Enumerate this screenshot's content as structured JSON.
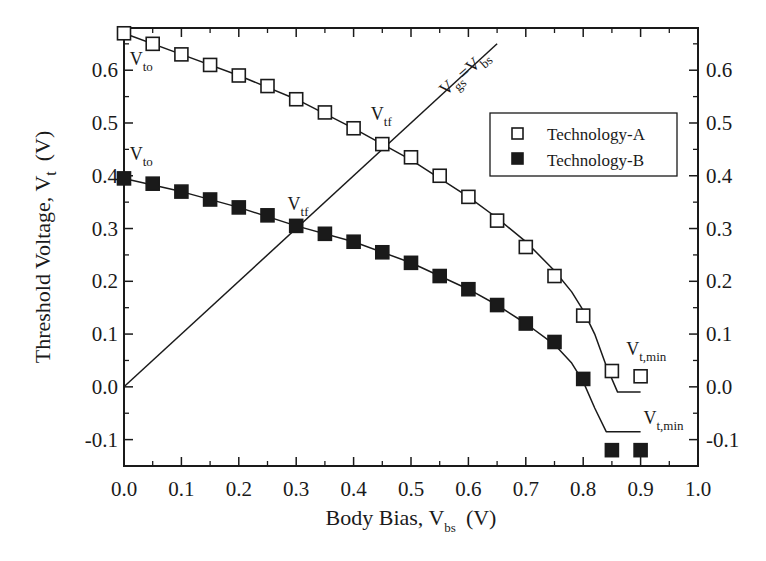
{
  "chart_data": {
    "type": "scatter",
    "title": "",
    "xlabel": "Body Bias, V",
    "xlabel_sub": "bs",
    "xlabel_unit": "(V)",
    "ylabel": "Threshold Voltage, V",
    "ylabel_sub": "t",
    "ylabel_unit": "(V)",
    "xlim": [
      0.0,
      1.0
    ],
    "ylim": [
      -0.15,
      0.68
    ],
    "x_ticks": [
      "0.0",
      "0.1",
      "0.2",
      "0.3",
      "0.4",
      "0.5",
      "0.6",
      "0.7",
      "0.8",
      "0.9",
      "1.0"
    ],
    "x_tick_values": [
      0.0,
      0.1,
      0.2,
      0.3,
      0.4,
      0.5,
      0.6,
      0.7,
      0.8,
      0.9,
      1.0
    ],
    "y_ticks": [
      "-0.1",
      "0.0",
      "0.1",
      "0.2",
      "0.3",
      "0.4",
      "0.5",
      "0.6"
    ],
    "y_tick_values": [
      -0.1,
      0.0,
      0.1,
      0.2,
      0.3,
      0.4,
      0.5,
      0.6
    ],
    "right_axis_mirrors_left": true,
    "grid": false,
    "legend": {
      "placement": "upper-right",
      "entries": [
        {
          "label": "Technology-A",
          "marker": "open-square"
        },
        {
          "label": "Technology-B",
          "marker": "filled-square"
        }
      ]
    },
    "series": [
      {
        "name": "Technology-A",
        "marker": "open-square",
        "x": [
          0.0,
          0.05,
          0.1,
          0.15,
          0.2,
          0.25,
          0.3,
          0.35,
          0.4,
          0.45,
          0.5,
          0.55,
          0.6,
          0.65,
          0.7,
          0.75,
          0.8,
          0.85,
          0.9
        ],
        "values": [
          0.67,
          0.65,
          0.63,
          0.61,
          0.59,
          0.57,
          0.545,
          0.52,
          0.49,
          0.46,
          0.435,
          0.4,
          0.36,
          0.315,
          0.265,
          0.21,
          0.135,
          0.03,
          0.02
        ]
      },
      {
        "name": "Technology-B",
        "marker": "filled-square",
        "x": [
          0.0,
          0.05,
          0.1,
          0.15,
          0.2,
          0.25,
          0.3,
          0.35,
          0.4,
          0.45,
          0.5,
          0.55,
          0.6,
          0.65,
          0.7,
          0.75,
          0.8,
          0.85,
          0.9
        ],
        "values": [
          0.395,
          0.385,
          0.37,
          0.355,
          0.34,
          0.325,
          0.305,
          0.29,
          0.275,
          0.255,
          0.235,
          0.21,
          0.185,
          0.155,
          0.12,
          0.085,
          0.015,
          -0.12,
          -0.12
        ]
      }
    ],
    "fit_curves": [
      {
        "name": "Technology-A model",
        "x": [
          0.0,
          0.1,
          0.2,
          0.3,
          0.4,
          0.45,
          0.5,
          0.55,
          0.6,
          0.65,
          0.7,
          0.75,
          0.78,
          0.8,
          0.82,
          0.84,
          0.86,
          0.9
        ],
        "values": [
          0.67,
          0.63,
          0.59,
          0.545,
          0.49,
          0.46,
          0.43,
          0.395,
          0.36,
          0.32,
          0.275,
          0.22,
          0.18,
          0.145,
          0.1,
          0.04,
          -0.01,
          -0.01
        ]
      },
      {
        "name": "Technology-B model",
        "x": [
          0.0,
          0.1,
          0.2,
          0.3,
          0.4,
          0.5,
          0.6,
          0.65,
          0.7,
          0.75,
          0.78,
          0.8,
          0.82,
          0.84,
          0.9
        ],
        "values": [
          0.395,
          0.37,
          0.34,
          0.305,
          0.275,
          0.235,
          0.185,
          0.155,
          0.12,
          0.08,
          0.045,
          0.01,
          -0.04,
          -0.085,
          -0.085
        ]
      },
      {
        "name": "Vgs=Vbs line",
        "x": [
          0.0,
          0.65
        ],
        "values": [
          0.0,
          0.65
        ]
      }
    ],
    "annotations": [
      {
        "text": "V",
        "sub": "to",
        "x": 0.01,
        "y": 0.61,
        "series": "Technology-A"
      },
      {
        "text": "V",
        "sub": "to",
        "x": 0.01,
        "y": 0.43,
        "series": "Technology-B"
      },
      {
        "text": "V",
        "sub": "tf",
        "x": 0.43,
        "y": 0.505,
        "series": "Technology-A"
      },
      {
        "text": "V",
        "sub": "tf",
        "x": 0.285,
        "y": 0.335,
        "series": "Technology-B"
      },
      {
        "text": "V",
        "sub": "t,min",
        "x": 0.875,
        "y": 0.06,
        "series": "Technology-A"
      },
      {
        "text": "V",
        "sub": "t,min",
        "x": 0.905,
        "y": -0.07,
        "series": "Technology-B"
      },
      {
        "text": "V",
        "sub": "gs",
        "text2": "=V",
        "sub2": "bs",
        "x": 0.56,
        "y": 0.55,
        "label": "diagonal"
      }
    ]
  }
}
